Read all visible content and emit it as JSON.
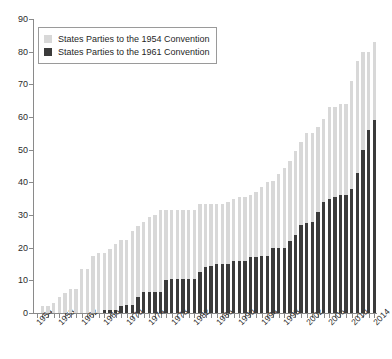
{
  "chart_data": {
    "type": "bar",
    "stacked": true,
    "title": "",
    "subtitle": "",
    "xlabel": "",
    "ylabel": "",
    "ylim": [
      0,
      90
    ],
    "ytick_step": 10,
    "yticks": [
      0,
      10,
      20,
      30,
      40,
      50,
      60,
      70,
      80,
      90
    ],
    "grid": false,
    "legend_position": "top-left",
    "xtick_labels": [
      "1954",
      "1958",
      "1962",
      "1966",
      "1970",
      "1974",
      "1978",
      "1982",
      "1986",
      "1990",
      "1994",
      "1998",
      "2002",
      "2006",
      "2010",
      "2014"
    ],
    "xtick_step_years": 4,
    "categories": [
      "1954",
      "1955",
      "1956",
      "1957",
      "1958",
      "1959",
      "1960",
      "1961",
      "1962",
      "1963",
      "1964",
      "1965",
      "1966",
      "1967",
      "1968",
      "1969",
      "1970",
      "1971",
      "1972",
      "1973",
      "1974",
      "1975",
      "1976",
      "1977",
      "1978",
      "1979",
      "1980",
      "1981",
      "1982",
      "1983",
      "1984",
      "1985",
      "1986",
      "1987",
      "1988",
      "1989",
      "1990",
      "1991",
      "1992",
      "1993",
      "1994",
      "1995",
      "1996",
      "1997",
      "1998",
      "1999",
      "2000",
      "2001",
      "2002",
      "2003",
      "2004",
      "2005",
      "2006",
      "2007",
      "2008",
      "2009",
      "2010",
      "2011",
      "2012",
      "2013",
      "2014"
    ],
    "series": [
      {
        "name": "States Parties to the 1954 Convention",
        "color": "#d8d8d8",
        "values": [
          0,
          2,
          2,
          3,
          5,
          6,
          7.5,
          7.5,
          13.5,
          13.5,
          17.5,
          18.5,
          18.5,
          19.5,
          21,
          22.5,
          22.5,
          25,
          26.5,
          28,
          29.5,
          30,
          31.5,
          31.5,
          31.5,
          31.5,
          31.5,
          31.5,
          31.5,
          33.5,
          33.5,
          33.5,
          33.5,
          33.5,
          34,
          35,
          35.5,
          35.5,
          36,
          37,
          38.5,
          40,
          40.5,
          42.5,
          44.5,
          46.5,
          49.5,
          52.5,
          55,
          55,
          57,
          59.5,
          63,
          63,
          64,
          64,
          71,
          77,
          80,
          80,
          83
        ]
      },
      {
        "name": "States Parties to the 1961 Convention",
        "color": "#3b3b3b",
        "values": [
          0,
          0,
          0,
          0,
          0,
          0,
          0,
          0,
          0,
          0,
          0,
          0,
          1,
          1,
          1,
          2,
          2.5,
          2.5,
          5,
          6.5,
          6.5,
          6.5,
          6.5,
          10,
          10.5,
          10.5,
          10.5,
          10.5,
          10.5,
          12.5,
          14,
          14.5,
          15,
          15,
          15,
          16,
          16,
          16,
          17,
          17,
          17.5,
          17.5,
          20,
          20,
          20,
          22,
          24,
          27,
          27.5,
          28,
          31,
          34,
          35,
          35.5,
          36,
          36,
          38,
          43,
          50,
          56,
          59
        ]
      }
    ]
  },
  "legend": {
    "items": [
      {
        "label": "States Parties to the 1954 Convention",
        "color": "#d8d8d8"
      },
      {
        "label": "States Parties to the 1961 Convention",
        "color": "#3b3b3b"
      }
    ]
  }
}
